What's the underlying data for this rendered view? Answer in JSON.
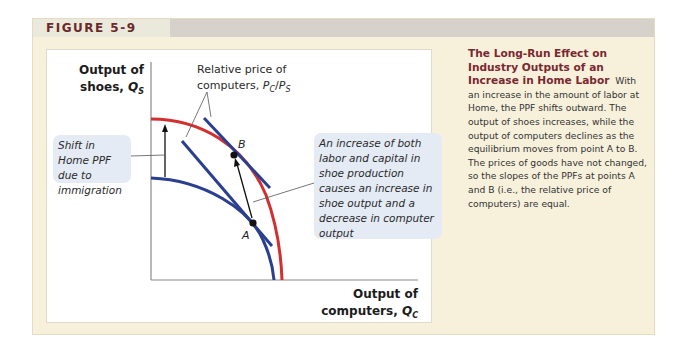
{
  "figure": {
    "label": "FIGURE 5-9"
  },
  "chart": {
    "y_axis_label_line1": "Output of",
    "y_axis_label_line2_text": "shoes, ",
    "y_axis_label_var": "Q",
    "y_axis_label_sub": "S",
    "x_axis_label_line1": "Output of",
    "x_axis_label_line2_text": "computers, ",
    "x_axis_label_var": "Q",
    "x_axis_label_sub": "C",
    "price_label_line1": "Relative price of",
    "price_label_line2_text": "computers, ",
    "price_label_num": "P",
    "price_label_num_sub": "C",
    "price_label_slash": "/",
    "price_label_den": "P",
    "price_label_den_sub": "S",
    "point_a": "A",
    "point_b": "B",
    "shift_callout": "Shift in Home PPF due to immigration",
    "increase_callout": "An increase of both labor and capital in shoe production causes an increase in shoe output and a decrease in computer output",
    "colors": {
      "original_ppf": "#2b3f91",
      "new_ppf": "#d32f2f",
      "price_lines": "#2b3f91",
      "axis": "#8a8a8a"
    }
  },
  "description": {
    "title": "The Long-Run Effect on Industry Outputs of an Increase in Home Labor",
    "body": "With an increase in the amount of labor at Home, the PPF shifts outward. The output of shoes increases, while the output of computers declines as the equilibrium moves from point A to B. The prices of goods have not changed, so the slopes of the PPFs at points A and B (i.e., the relative price of computers) are equal."
  }
}
